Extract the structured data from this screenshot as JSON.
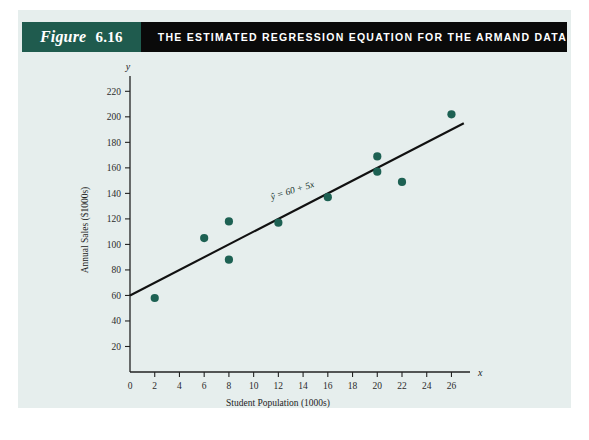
{
  "header": {
    "figure_word": "Figure",
    "figure_number": "6.16",
    "title": "THE ESTIMATED REGRESSION EQUATION FOR THE ARMAND DATA",
    "band_color": "#1f5b4e",
    "title_band_color": "#0a0a0a"
  },
  "panel": {
    "background_color": "#e6eeed"
  },
  "chart_data": {
    "type": "scatter",
    "title": "THE ESTIMATED REGRESSION EQUATION FOR THE ARMAND DATA",
    "xlabel": "Student Population (1000s)",
    "ylabel": "Annual Sales ($1000s)",
    "x_axis_variable": "x",
    "y_axis_variable": "y",
    "xlim": [
      0,
      27.5
    ],
    "ylim": [
      0,
      232
    ],
    "xticks": [
      0,
      2,
      4,
      6,
      8,
      10,
      12,
      14,
      16,
      18,
      20,
      22,
      24,
      26
    ],
    "yticks": [
      20,
      40,
      60,
      80,
      100,
      120,
      140,
      160,
      180,
      200,
      220
    ],
    "grid": false,
    "legend": "none",
    "marker_color": "#1d6153",
    "line_color": "#111111",
    "points": [
      {
        "x": 2,
        "y": 58
      },
      {
        "x": 6,
        "y": 105
      },
      {
        "x": 8,
        "y": 88
      },
      {
        "x": 8,
        "y": 118
      },
      {
        "x": 12,
        "y": 117
      },
      {
        "x": 16,
        "y": 137
      },
      {
        "x": 20,
        "y": 157
      },
      {
        "x": 20,
        "y": 169
      },
      {
        "x": 22,
        "y": 149
      },
      {
        "x": 26,
        "y": 202
      }
    ],
    "series": [
      {
        "name": "Estimated regression line",
        "type": "line",
        "equation": "ŷ = 60 + 5x",
        "intercept": 60,
        "slope": 5,
        "x_range": [
          0,
          27
        ]
      }
    ],
    "annotations": [
      {
        "text": "ŷ = 60 + 5x",
        "x": 13.2,
        "y": 140,
        "rotation": -17
      }
    ]
  }
}
